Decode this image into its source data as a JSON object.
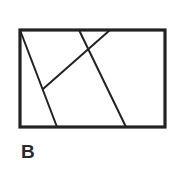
{
  "figure": {
    "label": "B",
    "stroke_color": "#222222",
    "rectangle": {
      "x": 20,
      "y": 30,
      "width": 145,
      "height": 97,
      "stroke_width": 3.2
    },
    "lines": [
      {
        "id": "line-left-slant",
        "x1": 20,
        "y1": 30,
        "x2": 57,
        "y2": 127
      },
      {
        "id": "line-right-slant",
        "x1": 79,
        "y1": 30,
        "x2": 126,
        "y2": 127
      },
      {
        "id": "line-cross-diagonal",
        "x1": 110,
        "y1": 30,
        "x2": 43,
        "y2": 89
      }
    ],
    "line_stroke_width": 2
  }
}
